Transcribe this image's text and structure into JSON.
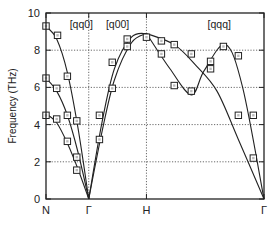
{
  "chart_data": {
    "type": "line",
    "title": "",
    "xlabel": "",
    "ylabel": "Frequency (THz)",
    "ylim": [
      0,
      10
    ],
    "yticks": [
      0,
      2,
      4,
      6,
      8,
      10
    ],
    "ytick_labels": [
      "0",
      "2",
      "4",
      "6",
      "8",
      "10"
    ],
    "x_points": [
      "N",
      "Γ",
      "H",
      "Γ"
    ],
    "x_positions": [
      0,
      1,
      2.35,
      5.1
    ],
    "grid": "dotted",
    "region_labels": [
      "[qq0]",
      "[q00]",
      "[qqq]"
    ],
    "series": [
      {
        "name": "[qq0] branch 1 (curve)",
        "x": [
          0,
          0.25,
          0.5,
          0.75,
          1.0
        ],
        "values": [
          9.3,
          8.6,
          6.8,
          3.8,
          0
        ]
      },
      {
        "name": "[qq0] branch 2 (curve)",
        "x": [
          0,
          0.25,
          0.5,
          0.75,
          1.0
        ],
        "values": [
          6.5,
          5.8,
          4.5,
          2.5,
          0
        ]
      },
      {
        "name": "[qq0] branch 3 (curve)",
        "x": [
          0,
          0.25,
          0.5,
          0.75,
          1.0
        ],
        "values": [
          4.6,
          4.1,
          3.0,
          1.6,
          0
        ]
      },
      {
        "name": "[q00] branch 1 (curve)",
        "x": [
          1.0,
          1.3,
          1.6,
          2.0,
          2.35
        ],
        "values": [
          0,
          4.0,
          7.0,
          8.7,
          8.9
        ]
      },
      {
        "name": "[q00] branch 2 (curve)",
        "x": [
          1.0,
          1.3,
          1.6,
          2.0,
          2.35
        ],
        "values": [
          0,
          3.5,
          6.4,
          8.4,
          8.9
        ]
      },
      {
        "name": "[qqq] branch 1 (curve)",
        "x": [
          2.35,
          3.0,
          3.5,
          4.0,
          4.5,
          5.1
        ],
        "values": [
          8.9,
          8.3,
          7.2,
          5.8,
          3.2,
          0
        ]
      },
      {
        "name": "[qqq] branch 2 (curve)",
        "x": [
          2.35,
          2.9,
          3.4,
          3.7,
          4.2,
          4.6,
          5.1
        ],
        "values": [
          8.9,
          7.0,
          5.6,
          6.9,
          8.3,
          6.0,
          0
        ]
      }
    ],
    "markers": [
      {
        "x": 0.0,
        "y": 9.3
      },
      {
        "x": 0.27,
        "y": 8.8
      },
      {
        "x": 0.5,
        "y": 6.6
      },
      {
        "x": 0.0,
        "y": 6.5
      },
      {
        "x": 0.25,
        "y": 5.95
      },
      {
        "x": 0.5,
        "y": 4.5
      },
      {
        "x": 0.0,
        "y": 4.5
      },
      {
        "x": 0.25,
        "y": 4.3
      },
      {
        "x": 0.72,
        "y": 4.2
      },
      {
        "x": 0.5,
        "y": 3.1
      },
      {
        "x": 0.72,
        "y": 2.25
      },
      {
        "x": 0.72,
        "y": 1.55
      },
      {
        "x": 1.25,
        "y": 3.2
      },
      {
        "x": 1.25,
        "y": 4.5
      },
      {
        "x": 1.55,
        "y": 5.95
      },
      {
        "x": 1.55,
        "y": 7.35
      },
      {
        "x": 1.9,
        "y": 8.6
      },
      {
        "x": 1.9,
        "y": 8.2
      },
      {
        "x": 2.35,
        "y": 8.7
      },
      {
        "x": 2.7,
        "y": 8.5
      },
      {
        "x": 2.7,
        "y": 7.8
      },
      {
        "x": 3.0,
        "y": 8.3
      },
      {
        "x": 3.0,
        "y": 6.1
      },
      {
        "x": 3.4,
        "y": 7.8
      },
      {
        "x": 3.4,
        "y": 5.8
      },
      {
        "x": 3.85,
        "y": 7.4
      },
      {
        "x": 3.85,
        "y": 7.0
      },
      {
        "x": 4.15,
        "y": 8.2
      },
      {
        "x": 4.5,
        "y": 7.7
      },
      {
        "x": 4.5,
        "y": 4.5
      },
      {
        "x": 4.85,
        "y": 4.5
      },
      {
        "x": 4.85,
        "y": 2.2
      }
    ]
  }
}
